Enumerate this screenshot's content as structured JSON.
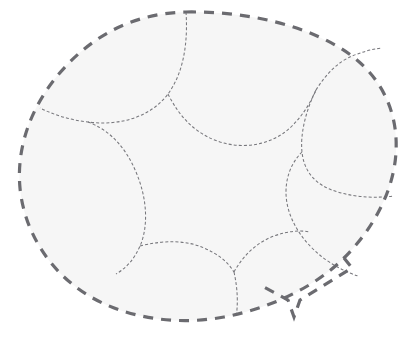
{
  "figure": {
    "width": 416,
    "height": 342,
    "background_color": "#ffffff"
  },
  "colors": {
    "background": "#ffffff",
    "region_fill": "#f6f6f6",
    "outer_stroke": "#6b6b70",
    "interior_stroke": "#77777c"
  },
  "strokes": {
    "outer_width": 3.2,
    "outer_dasharray": "10 8",
    "interior_width": 1.05,
    "interior_dasharray": "3 2.1"
  },
  "shapes": {
    "outer_boundary": {
      "name": "outer-dashed-blob",
      "path": "M 186 12 C 248 11, 312 26, 352 56 C 386 82, 398 118, 396 152 C 394 190, 374 228, 344 258 C 316 286, 272 308, 224 317 C 176 326, 124 318, 86 294 C 48 270, 24 230, 20 188 C 16 146, 32 102, 66 66 C 98 32, 138 13, 186 12 Z"
    },
    "notch": {
      "name": "bottom-right-notch",
      "path": "M 344 258 L 352 268 L 300 300 L 294 317 L 288 300 L 262 286"
    },
    "interior_curves": [
      {
        "name": "interior-curve-top-left",
        "path": "M 186 12 C 188 42, 184 72, 168 94 C 150 118, 118 126, 88 122 C 70 120, 54 115, 40 108"
      },
      {
        "name": "interior-curve-top-center",
        "path": "M 168 94 C 180 118, 196 134, 220 142 C 246 150, 274 144, 292 126 C 302 116, 310 104, 316 90"
      },
      {
        "name": "interior-curve-top-right",
        "path": "M 316 90 C 326 74, 338 62, 352 56 C 362 52, 372 49, 382 48"
      },
      {
        "name": "interior-curve-right-mid",
        "path": "M 316 90 C 306 110, 300 134, 302 152 C 304 172, 316 186, 338 192 C 358 198, 378 198, 394 196"
      },
      {
        "name": "interior-curve-left-mid",
        "path": "M 88 122 C 110 130, 126 148, 136 172 C 148 200, 148 228, 140 246 C 134 260, 126 268, 116 274"
      },
      {
        "name": "interior-curve-bottom-left",
        "path": "M 140 246 C 164 240, 186 240, 204 248 C 218 254, 228 262, 234 272"
      },
      {
        "name": "interior-curve-bottom-center",
        "path": "M 234 272 C 238 290, 238 306, 236 317"
      },
      {
        "name": "interior-curve-bottom-right",
        "path": "M 234 272 C 244 254, 258 242, 274 236 C 288 231, 300 230, 310 232"
      },
      {
        "name": "interior-curve-right-lower",
        "path": "M 302 152 C 292 162, 286 176, 286 192 C 286 212, 296 232, 312 248 C 328 264, 346 272, 358 276"
      }
    ]
  },
  "annotations": {
    "cell_count": 7,
    "junction_points": [
      {
        "name": "junction-top-left",
        "x": 168,
        "y": 94
      },
      {
        "name": "junction-top-right",
        "x": 316,
        "y": 90
      },
      {
        "name": "junction-left",
        "x": 88,
        "y": 122
      },
      {
        "name": "junction-right",
        "x": 302,
        "y": 152
      },
      {
        "name": "junction-bottom-left",
        "x": 140,
        "y": 246
      },
      {
        "name": "junction-bottom-center",
        "x": 234,
        "y": 272
      }
    ]
  }
}
